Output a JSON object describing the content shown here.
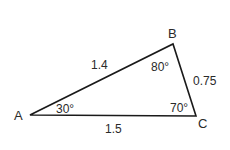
{
  "diagram": {
    "type": "triangle",
    "stroke_color": "#1a1a1a",
    "vertices": [
      {
        "id": "A",
        "label": "A",
        "x": 30,
        "y": 115
      },
      {
        "id": "B",
        "label": "B",
        "x": 173,
        "y": 44
      },
      {
        "id": "C",
        "label": "C",
        "x": 196,
        "y": 116
      }
    ],
    "sides": {
      "AB": "1.4",
      "BC": "0.75",
      "AC": "1.5"
    },
    "angles": {
      "A": "30°",
      "B": "80°",
      "C": "70°"
    }
  }
}
